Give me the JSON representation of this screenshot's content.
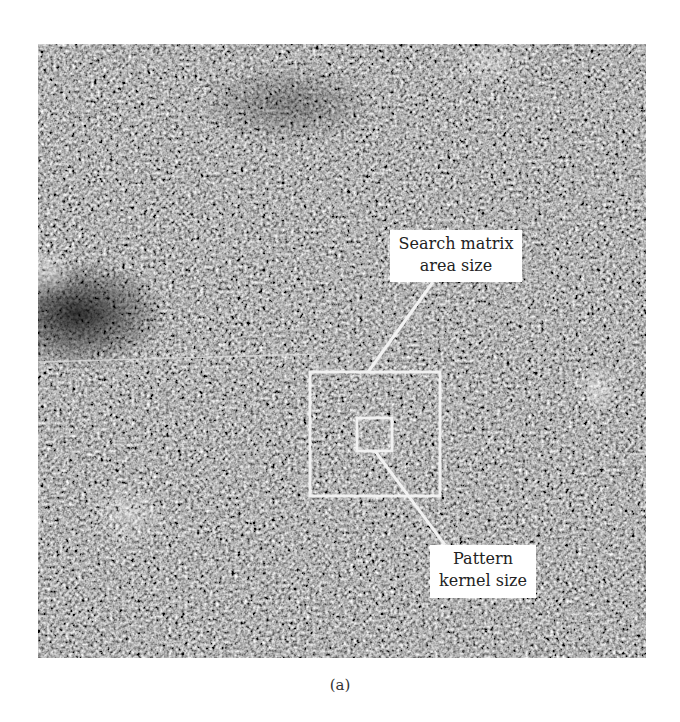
{
  "figure": {
    "labels": {
      "search_matrix": [
        "Search matrix",
        "area size"
      ],
      "pattern_kernel": [
        "Pattern",
        "kernel size"
      ]
    },
    "caption": "(a)"
  },
  "annotations": {
    "search_box": {
      "x": 310,
      "y": 372,
      "width": 130,
      "height": 124
    },
    "kernel_box": {
      "x": 357,
      "y": 418,
      "width": 35,
      "height": 33
    },
    "leader_search": {
      "x1": 433,
      "y1": 282,
      "x2": 368,
      "y2": 372
    },
    "leader_kernel": {
      "x1": 375,
      "y1": 451,
      "x2": 445,
      "y2": 545
    },
    "line_color": "#f2f2f2"
  }
}
